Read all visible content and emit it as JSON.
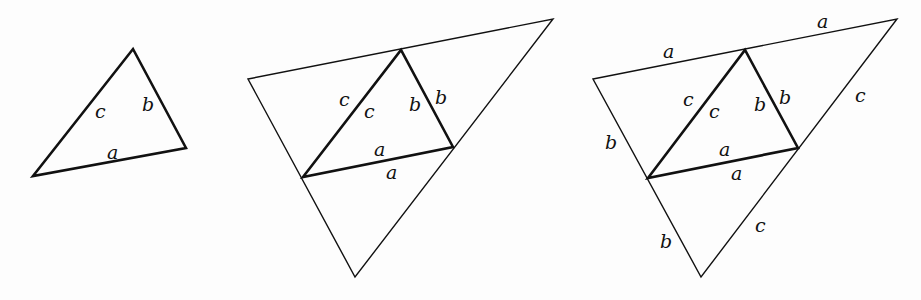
{
  "figure": {
    "panels": [
      {
        "id": "panel-1",
        "thick_triangle": [
          [
            33,
            176
          ],
          [
            133,
            49
          ],
          [
            186,
            148
          ]
        ],
        "outer_triangle": null,
        "labels": [
          {
            "text": "c",
            "x": 95,
            "y": 118
          },
          {
            "text": "b",
            "x": 142,
            "y": 111
          },
          {
            "text": "a",
            "x": 107,
            "y": 159
          }
        ]
      },
      {
        "id": "panel-2",
        "thick_triangle": [
          [
            303,
            177
          ],
          [
            401,
            50
          ],
          [
            453,
            147
          ]
        ],
        "outer_triangle": [
          [
            248,
            79
          ],
          [
            553,
            19
          ],
          [
            355,
            277
          ]
        ],
        "labels": [
          {
            "text": "c",
            "x": 339,
            "y": 106
          },
          {
            "text": "c",
            "x": 364,
            "y": 118
          },
          {
            "text": "b",
            "x": 409,
            "y": 111
          },
          {
            "text": "b",
            "x": 435,
            "y": 104
          },
          {
            "text": "a",
            "x": 374,
            "y": 156
          },
          {
            "text": "a",
            "x": 386,
            "y": 179
          }
        ]
      },
      {
        "id": "panel-3",
        "thick_triangle": [
          [
            648,
            178
          ],
          [
            745,
            50
          ],
          [
            798,
            148
          ]
        ],
        "outer_triangle": [
          [
            593,
            79
          ],
          [
            897,
            19
          ],
          [
            701,
            277
          ]
        ],
        "labels": [
          {
            "text": "a",
            "x": 663,
            "y": 58
          },
          {
            "text": "a",
            "x": 817,
            "y": 28
          },
          {
            "text": "c",
            "x": 683,
            "y": 106
          },
          {
            "text": "c",
            "x": 709,
            "y": 118
          },
          {
            "text": "b",
            "x": 754,
            "y": 111
          },
          {
            "text": "b",
            "x": 779,
            "y": 104
          },
          {
            "text": "c",
            "x": 855,
            "y": 102
          },
          {
            "text": "b",
            "x": 605,
            "y": 149
          },
          {
            "text": "a",
            "x": 719,
            "y": 156
          },
          {
            "text": "a",
            "x": 731,
            "y": 180
          },
          {
            "text": "c",
            "x": 755,
            "y": 232
          },
          {
            "text": "b",
            "x": 660,
            "y": 248
          }
        ]
      }
    ]
  }
}
